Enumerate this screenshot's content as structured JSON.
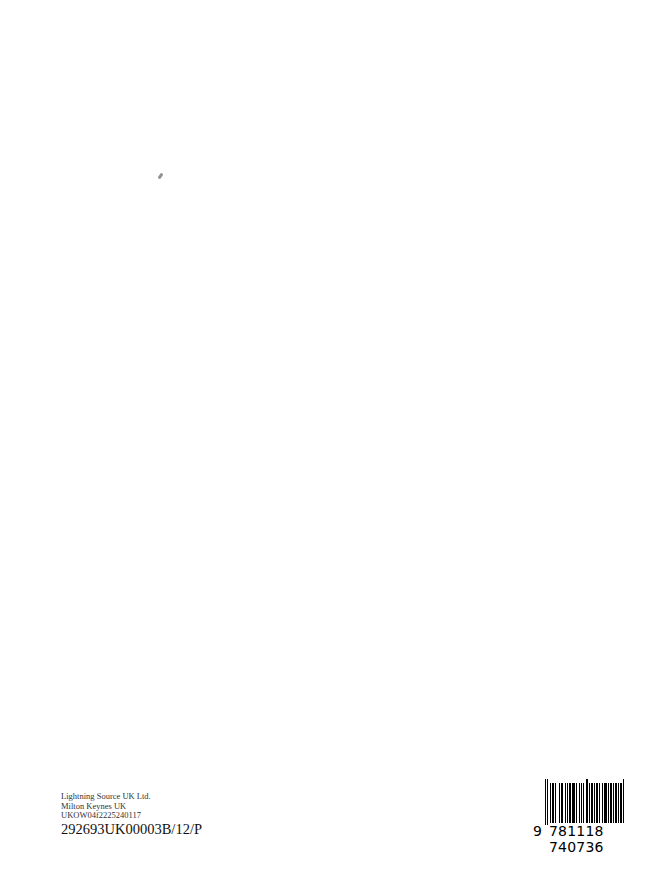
{
  "imprint": {
    "line1": "Lightning Source UK Ltd.",
    "line2": "Milton Keynes UK",
    "line3": "UKOW04f2225240117",
    "line4": "292693UK00003B/12/P"
  },
  "barcode": {
    "first_digit": "9",
    "digits": "781118 740736",
    "isbn": "9781118740736"
  }
}
